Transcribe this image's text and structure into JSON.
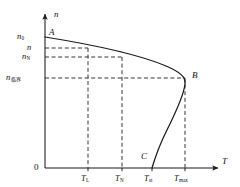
{
  "figure": {
    "kind": "speed-torque-characteristic-curve",
    "background": "#ffffff",
    "line_color": "#1a1a1a",
    "dash_color": "#2b2b2b",
    "axes": {
      "y_axis_label": "n",
      "x_axis_label": "T",
      "origin_label": "0",
      "y_axis_x": 45,
      "x_axis_y": 168,
      "y_axis_top": 14,
      "x_axis_right": 218
    },
    "y_ticks": [
      {
        "id": "n0",
        "base": "n",
        "sub": "0",
        "sub_type": "plain",
        "y": 37,
        "label_x": 17
      },
      {
        "id": "n",
        "base": "n",
        "sub": "",
        "sub_type": "none",
        "y": 48,
        "label_x": 27
      },
      {
        "id": "nN",
        "base": "n",
        "sub": "N",
        "sub_type": "plain",
        "y": 57,
        "label_x": 22
      },
      {
        "id": "ncritical",
        "base": "n",
        "sub": "临界",
        "sub_type": "cjk",
        "y": 78,
        "label_x": 6
      }
    ],
    "x_ticks": [
      {
        "id": "TL",
        "base": "T",
        "sub": "L",
        "sub_type": "plain",
        "x": 88,
        "label_x": 81
      },
      {
        "id": "TN",
        "base": "T",
        "sub": "N",
        "sub_type": "plain",
        "x": 122,
        "label_x": 115
      },
      {
        "id": "Tst",
        "base": "T",
        "sub": "st",
        "sub_type": "plain",
        "x": 152,
        "label_x": 144
      },
      {
        "id": "Tmax",
        "base": "T",
        "sub": "max",
        "sub_type": "plain",
        "x": 185,
        "label_x": 174
      }
    ],
    "points": [
      {
        "id": "A",
        "label": "A",
        "x": 45,
        "y": 37,
        "label_x": 49,
        "label_y": 28
      },
      {
        "id": "B",
        "label": "B",
        "x": 185,
        "y": 78,
        "label_x": 192,
        "label_y": 71
      },
      {
        "id": "C",
        "label": "C",
        "x": 152,
        "y": 168,
        "label_x": 141,
        "label_y": 152
      }
    ],
    "dashed_horizontal": [
      {
        "from_tick": "n",
        "y": 48,
        "x_start": 45,
        "x_end": 88
      },
      {
        "from_tick": "nN",
        "y": 57,
        "x_start": 45,
        "x_end": 122
      },
      {
        "from_tick": "ncritical",
        "y": 78,
        "x_start": 45,
        "x_end": 185
      }
    ],
    "dashed_vertical": [
      {
        "from_tick": "TL",
        "x": 88,
        "y_start": 48,
        "y_end": 168
      },
      {
        "from_tick": "TN",
        "x": 122,
        "y_start": 57,
        "y_end": 168
      },
      {
        "from_tick": "Tmax",
        "x": 185,
        "y_start": 78,
        "y_end": 168
      }
    ],
    "curve_path": "M 45,37 C 95,45 140,55 166,66 C 180,72 186,77 185,84 C 184,95 176,112 166,132 C 159,146 155,158 152,168"
  }
}
